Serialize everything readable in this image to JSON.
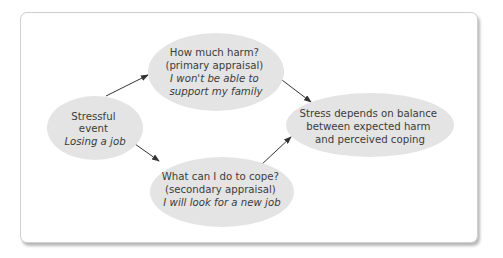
{
  "colors": {
    "node_fill": "#e4e4e4",
    "text": "#3c3c3c",
    "arrow": "#333333",
    "frame_border": "#cfcfcf"
  },
  "nodes": {
    "stressful_event": {
      "lines": [
        "Stressful",
        "event"
      ],
      "example": "Losing a job"
    },
    "primary_appraisal": {
      "lines": [
        "How much harm?",
        "(primary appraisal)"
      ],
      "example_lines": [
        "I won't be able to",
        "support my family"
      ]
    },
    "secondary_appraisal": {
      "lines": [
        "What can I do to cope?",
        "(secondary appraisal)"
      ],
      "example": "I will look for a new job"
    },
    "outcome": {
      "lines": [
        "Stress depends on balance",
        "between expected harm",
        "and perceived coping"
      ]
    }
  },
  "edges": [
    {
      "from": "stressful_event",
      "to": "primary_appraisal"
    },
    {
      "from": "primary_appraisal",
      "to": "outcome"
    },
    {
      "from": "stressful_event",
      "to": "secondary_appraisal"
    },
    {
      "from": "secondary_appraisal",
      "to": "outcome"
    }
  ]
}
